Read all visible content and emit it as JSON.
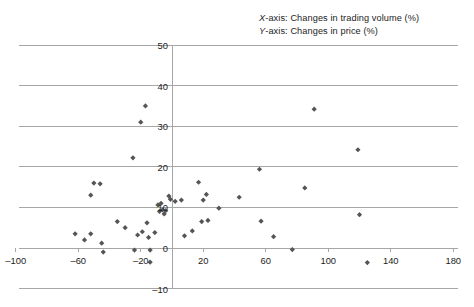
{
  "legend": {
    "x_axis_note_prefix": "X",
    "x_axis_note": "X-axis: Changes in trading volume (%)",
    "y_axis_note": "Y-axis: Changes in price (%)"
  },
  "colors": {
    "marker": "#555555",
    "gridline": "#a6a6a6",
    "axis": "#a6a6a6",
    "text": "#1c1c1c",
    "background": "#ffffff"
  },
  "chart_data": {
    "type": "scatter",
    "title": "",
    "xlabel": "Changes in trading volume (%)",
    "ylabel": "Changes in price (%)",
    "xlim": [
      -100,
      180
    ],
    "ylim": [
      -10,
      50
    ],
    "xticks": [
      -100,
      -60,
      -20,
      20,
      60,
      100,
      140,
      180
    ],
    "yticks": [
      -10,
      0,
      10,
      20,
      30,
      40,
      50
    ],
    "grid": "horizontal",
    "legend_position": "top-right",
    "marker_shape": "diamond",
    "marker_color": "#555555",
    "series": [
      {
        "name": "Stocks",
        "points": [
          [
            -62,
            3.5
          ],
          [
            -56,
            2.0
          ],
          [
            -52,
            13.0
          ],
          [
            -52,
            3.5
          ],
          [
            -50,
            16.0
          ],
          [
            -46,
            15.8
          ],
          [
            -45,
            1.2
          ],
          [
            -44,
            -1.0
          ],
          [
            -35,
            6.5
          ],
          [
            -30,
            5.0
          ],
          [
            -25,
            22.2
          ],
          [
            -24,
            -0.5
          ],
          [
            -22,
            3.2
          ],
          [
            -20,
            31.0
          ],
          [
            -19,
            4.0
          ],
          [
            -17,
            35.0
          ],
          [
            -16,
            6.2
          ],
          [
            -15,
            2.6
          ],
          [
            -14,
            -0.5
          ],
          [
            -14,
            -3.5
          ],
          [
            -11,
            3.8
          ],
          [
            -9,
            10.6
          ],
          [
            -8,
            9.0
          ],
          [
            -7,
            11.0
          ],
          [
            -6,
            9.4
          ],
          [
            -5,
            8.4
          ],
          [
            -4,
            9.2
          ],
          [
            -2,
            12.8
          ],
          [
            -1,
            12.0
          ],
          [
            2,
            11.5
          ],
          [
            6,
            11.8
          ],
          [
            8,
            3.0
          ],
          [
            13,
            4.2
          ],
          [
            17,
            16.2
          ],
          [
            19,
            6.5
          ],
          [
            20,
            11.8
          ],
          [
            22,
            13.2
          ],
          [
            23,
            6.8
          ],
          [
            30,
            9.8
          ],
          [
            43,
            12.5
          ],
          [
            56,
            19.4
          ],
          [
            57,
            6.6
          ],
          [
            65,
            2.8
          ],
          [
            77,
            -0.4
          ],
          [
            85,
            14.8
          ],
          [
            91,
            34.2
          ],
          [
            119,
            24.2
          ],
          [
            120,
            8.2
          ],
          [
            125,
            -3.6
          ]
        ]
      }
    ]
  }
}
